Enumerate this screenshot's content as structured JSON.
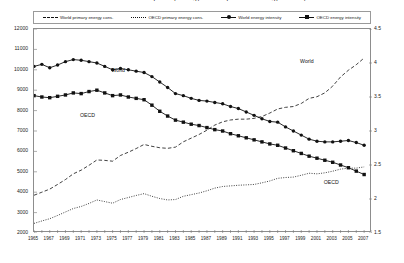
{
  "title": "World and OECD primary energy consumption and energy intensity",
  "legend": {
    "position": "top",
    "items": [
      {
        "label": "World primary energy cons.",
        "style": "dashed",
        "marker": "none",
        "axis": "left"
      },
      {
        "label": "OECD primary energy cons.",
        "style": "dotted",
        "marker": "none",
        "axis": "left"
      },
      {
        "label": "World energy intensity",
        "style": "solid",
        "marker": "circle",
        "axis": "right"
      },
      {
        "label": "OECD energy intensity",
        "style": "solid",
        "marker": "square",
        "axis": "right"
      }
    ]
  },
  "annotations": [
    {
      "text": "World",
      "series": "World energy intensity",
      "x": 1976,
      "y_right": 3.88
    },
    {
      "text": "OECD",
      "series": "OECD energy intensity",
      "x": 1972,
      "y_right": 3.22
    },
    {
      "text": "World",
      "series": "World primary energy cons.",
      "x": 2000,
      "y_left": 10400
    },
    {
      "text": "OECD",
      "series": "OECD primary energy cons.",
      "x": 2003,
      "y_left": 4450
    }
  ],
  "chart_data": {
    "type": "line",
    "title": "World and OECD primary energy consumption and energy intensity",
    "xlabel": "",
    "ylabel": "",
    "y2label": "",
    "xlim": [
      1965,
      2008
    ],
    "ylim": [
      2000,
      12000
    ],
    "y2lim": [
      1.5,
      4.5
    ],
    "yticks": [
      2000,
      3000,
      4000,
      5000,
      6000,
      7000,
      8000,
      9000,
      10000,
      11000,
      12000
    ],
    "y2ticks": [
      1.5,
      2,
      2.5,
      3,
      3.5,
      4,
      4.5
    ],
    "grid": false,
    "xtick_labels": [
      "1965",
      "1967",
      "1969",
      "1971",
      "1973",
      "1975",
      "1977",
      "1979",
      "1981",
      "1983",
      "1985",
      "1987",
      "1989",
      "1991",
      "1993",
      "1995",
      "1997",
      "1999",
      "2001",
      "2003",
      "2005",
      "2007"
    ],
    "x": [
      1965,
      1966,
      1967,
      1968,
      1969,
      1970,
      1971,
      1972,
      1973,
      1974,
      1975,
      1976,
      1977,
      1978,
      1979,
      1980,
      1981,
      1982,
      1983,
      1984,
      1985,
      1986,
      1987,
      1988,
      1989,
      1990,
      1991,
      1992,
      1993,
      1994,
      1995,
      1996,
      1997,
      1998,
      1999,
      2000,
      2001,
      2002,
      2003,
      2004,
      2005,
      2006,
      2007
    ],
    "series": [
      {
        "name": "World primary energy cons.",
        "axis": "left",
        "style": "dashed",
        "marker": "none",
        "values": [
          3850,
          4000,
          4150,
          4380,
          4620,
          4900,
          5080,
          5320,
          5580,
          5560,
          5520,
          5800,
          5960,
          6140,
          6340,
          6250,
          6180,
          6150,
          6210,
          6470,
          6650,
          6830,
          7040,
          7290,
          7450,
          7540,
          7580,
          7580,
          7620,
          7710,
          7880,
          8080,
          8160,
          8200,
          8350,
          8600,
          8680,
          8870,
          9200,
          9650,
          9980,
          10250,
          10580
        ]
      },
      {
        "name": "OECD primary energy cons.",
        "axis": "left",
        "style": "dotted",
        "marker": "none",
        "values": [
          2470,
          2590,
          2700,
          2860,
          3030,
          3200,
          3300,
          3450,
          3620,
          3540,
          3460,
          3640,
          3740,
          3840,
          3930,
          3800,
          3690,
          3620,
          3640,
          3800,
          3880,
          3960,
          4070,
          4200,
          4280,
          4310,
          4340,
          4360,
          4380,
          4460,
          4550,
          4680,
          4720,
          4740,
          4830,
          4930,
          4900,
          4950,
          5030,
          5130,
          5180,
          5180,
          5240
        ]
      },
      {
        "name": "World energy intensity",
        "axis": "right",
        "style": "solid",
        "marker": "circle",
        "values": [
          3.95,
          3.98,
          3.93,
          3.97,
          4.02,
          4.05,
          4.04,
          4.02,
          4.0,
          3.95,
          3.9,
          3.92,
          3.9,
          3.88,
          3.86,
          3.8,
          3.72,
          3.64,
          3.55,
          3.52,
          3.48,
          3.45,
          3.44,
          3.42,
          3.4,
          3.36,
          3.33,
          3.28,
          3.23,
          3.18,
          3.14,
          3.13,
          3.06,
          3.0,
          2.94,
          2.88,
          2.85,
          2.84,
          2.84,
          2.85,
          2.86,
          2.83,
          2.79
        ]
      },
      {
        "name": "OECD energy intensity",
        "axis": "right",
        "style": "solid",
        "marker": "square",
        "values": [
          3.52,
          3.5,
          3.49,
          3.51,
          3.53,
          3.56,
          3.55,
          3.58,
          3.6,
          3.56,
          3.52,
          3.53,
          3.5,
          3.48,
          3.46,
          3.38,
          3.29,
          3.22,
          3.16,
          3.13,
          3.1,
          3.08,
          3.05,
          3.02,
          3.0,
          2.96,
          2.93,
          2.9,
          2.87,
          2.84,
          2.81,
          2.79,
          2.75,
          2.71,
          2.67,
          2.63,
          2.6,
          2.57,
          2.54,
          2.5,
          2.46,
          2.41,
          2.36
        ]
      }
    ]
  }
}
